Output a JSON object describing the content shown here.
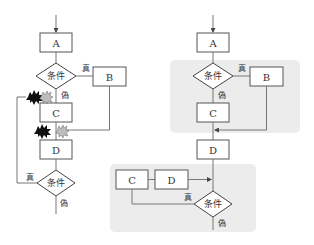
{
  "left_flowchart": {
    "title": "spaghetti-flowchart",
    "boxes": {
      "a": "A",
      "b": "B",
      "c": "C",
      "d": "D"
    },
    "decision_1": {
      "label": "条件",
      "true_label": "真",
      "false_label": "偽"
    },
    "decision_2": {
      "label": "条件",
      "true_label": "真",
      "false_label": "偽"
    },
    "markers": [
      "collision-black-icon",
      "collision-gray-icon",
      "collision-black-icon",
      "collision-gray-icon"
    ]
  },
  "right_flowchart": {
    "title": "structured-flowchart",
    "boxes": {
      "a": "A",
      "b": "B",
      "c": "C",
      "d": "D",
      "loop_c": "C",
      "loop_d": "D"
    },
    "decision_1": {
      "label": "条件",
      "true_label": "真",
      "false_label": "偽"
    },
    "decision_2": {
      "label": "条件",
      "true_label": "真",
      "false_label": "偽"
    },
    "colors": {
      "region_fill": "#ececec"
    }
  }
}
